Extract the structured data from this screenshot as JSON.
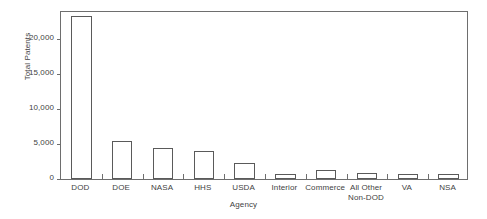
{
  "chart_data": {
    "type": "bar",
    "title": "",
    "xlabel": "Agency",
    "ylabel": "Total Patents",
    "categories": [
      "DOD",
      "DOE",
      "NASA",
      "HHS",
      "USDA",
      "Interior",
      "Commerce",
      "All Other\nNon-DOD",
      "VA",
      "NSA"
    ],
    "category_lines": [
      [
        "DOD"
      ],
      [
        "DOE"
      ],
      [
        "NASA"
      ],
      [
        "HHS"
      ],
      [
        "USDA"
      ],
      [
        "Interior"
      ],
      [
        "Commerce"
      ],
      [
        "All Other",
        "Non-DOD"
      ],
      [
        "VA"
      ],
      [
        "NSA"
      ]
    ],
    "values": [
      23350,
      5430,
      4470,
      3950,
      2290,
      720,
      1240,
      850,
      700,
      700
    ],
    "ylim": [
      0,
      24150
    ],
    "ytick_values": [
      0,
      5000,
      10000,
      15000,
      20000
    ],
    "ytick_labels": [
      "0",
      "5,000",
      "10,000",
      "15,000",
      "20,000"
    ],
    "grid": false,
    "legend": false,
    "bar_fill": "#ffffff",
    "bar_edge": "#5a5a5a",
    "frame_color": "#6e6e6e",
    "text_color": "#3f3f3f",
    "background": "#ffffff"
  }
}
